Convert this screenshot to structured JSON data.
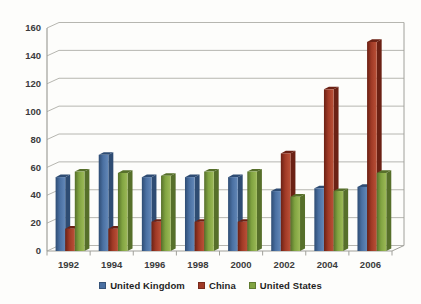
{
  "chart_data": {
    "type": "bar",
    "subtype": "3d-clustered-column",
    "title": "",
    "xlabel": "",
    "ylabel": "",
    "categories": [
      "1992",
      "1994",
      "1996",
      "1998",
      "2000",
      "2002",
      "2004",
      "2006"
    ],
    "series": [
      {
        "name": "United Kingdom",
        "color": "#4a70a2",
        "color_dark": "#2e4c73",
        "color_light": "#6388b8",
        "values": [
          53,
          69,
          53,
          53,
          53,
          43,
          45,
          46
        ]
      },
      {
        "name": "China",
        "color": "#a03a26",
        "color_dark": "#6b2114",
        "color_light": "#bb5138",
        "values": [
          16,
          16,
          21,
          21,
          21,
          70,
          116,
          150
        ]
      },
      {
        "name": "United States",
        "color": "#81a441",
        "color_dark": "#566f2a",
        "color_light": "#9dba58",
        "values": [
          57,
          56,
          54,
          57,
          57,
          39,
          43,
          56
        ]
      }
    ],
    "ylim": [
      0,
      160
    ],
    "yticks": [
      0,
      20,
      40,
      60,
      80,
      100,
      120,
      140,
      160
    ],
    "grid": true,
    "legend_position": "bottom"
  },
  "style": {
    "background": "#fdfdfb",
    "gridline_color": "#b6b6b0",
    "axis_color": "#a0a09a",
    "tick_label_color": "#3b3b3b",
    "legend_text_color": "#1f1f1f"
  }
}
